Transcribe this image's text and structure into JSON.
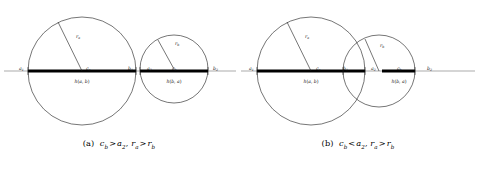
{
  "figure": {
    "name": "two-circle-hausdorff-interval-figure",
    "background_color": "#ffffff",
    "stroke_color": "#1a1a1a",
    "bold_segment_color": "#000000",
    "axis_color": "#555555"
  },
  "panels": [
    {
      "id": "a",
      "caption": {
        "tag": "(a)",
        "expr_1_lhs": "c",
        "expr_1_lhs_sub": "b",
        "expr_1_rel": ">",
        "expr_1_rhs": "a",
        "expr_1_rhs_sub": "2",
        "separator": ", ",
        "expr_2_lhs": "r",
        "expr_2_lhs_sub": "a",
        "expr_2_rel": ">",
        "expr_2_rhs": "r",
        "expr_2_rhs_sub": "b",
        "full_text": "(a) c_b > a_2, r_a > r_b"
      },
      "axis": {
        "y": 71,
        "x_start": 4,
        "x_end": 236
      },
      "circles": [
        {
          "name": "circle-a",
          "cx": 82,
          "cy": 71,
          "r": 54
        },
        {
          "name": "circle-b",
          "cx": 174,
          "cy": 69,
          "r": 34
        }
      ],
      "bold_intervals": [
        {
          "name": "interval-h-a-b",
          "x1": 28,
          "x2": 136,
          "y": 71,
          "label": "h(a, b)",
          "label_x": 82,
          "label_y": 83
        },
        {
          "name": "interval-h-b-a",
          "x1": 140,
          "x2": 208,
          "y": 71,
          "label": "h(b, a)",
          "label_x": 174,
          "label_y": 83
        }
      ],
      "radii": [
        {
          "name": "radius-ra",
          "x1": 82,
          "y1": 71,
          "x2": 58,
          "y2": 22,
          "label": "r",
          "label_sub": "a",
          "label_x": 76,
          "label_y": 38
        },
        {
          "name": "radius-rb",
          "x1": 174,
          "y1": 69,
          "x2": 158,
          "y2": 40,
          "label": "r",
          "label_sub": "b",
          "label_x": 175,
          "label_y": 45
        }
      ],
      "point_labels": [
        {
          "name": "label-a1",
          "text": "a",
          "sub": "1",
          "x": 19,
          "y": 70
        },
        {
          "name": "label-ca",
          "text": "c",
          "sub": "a",
          "x": 86,
          "y": 70
        },
        {
          "name": "label-b1",
          "text": "b",
          "sub": "1",
          "x": 128,
          "y": 70
        },
        {
          "name": "label-a2",
          "text": "a",
          "sub": "2",
          "x": 147,
          "y": 70
        },
        {
          "name": "label-cb",
          "text": "c",
          "sub": "b",
          "x": 172,
          "y": 70
        },
        {
          "name": "label-b2",
          "text": "b",
          "sub": "2",
          "x": 213,
          "y": 70
        }
      ]
    },
    {
      "id": "b",
      "caption": {
        "tag": "(b)",
        "expr_1_lhs": "c",
        "expr_1_lhs_sub": "b",
        "expr_1_rel": "<",
        "expr_1_rhs": "a",
        "expr_1_rhs_sub": "2",
        "separator": ", ",
        "expr_2_lhs": "r",
        "expr_2_lhs_sub": "a",
        "expr_2_rel": ">",
        "expr_2_rhs": "r",
        "expr_2_rhs_sub": "b",
        "full_text": "(b) c_b < a_2, r_a > r_b"
      },
      "axis": {
        "y": 71,
        "x_start": 2,
        "x_end": 236
      },
      "circles": [
        {
          "name": "circle-a",
          "cx": 72,
          "cy": 71,
          "r": 54
        },
        {
          "name": "circle-b",
          "cx": 140,
          "cy": 71,
          "r": 36
        }
      ],
      "bold_intervals": [
        {
          "name": "interval-h-a-b",
          "x1": 18,
          "x2": 126,
          "y": 71,
          "label": "h(a, b)",
          "label_x": 72,
          "label_y": 83
        },
        {
          "name": "interval-h-b-a",
          "x1": 143,
          "x2": 176,
          "y": 71,
          "label": "h(b, a)",
          "label_x": 160,
          "label_y": 83
        }
      ],
      "radii": [
        {
          "name": "radius-ra",
          "x1": 72,
          "y1": 71,
          "x2": 48,
          "y2": 22,
          "label": "r",
          "label_sub": "a",
          "label_x": 66,
          "label_y": 38
        },
        {
          "name": "radius-rb",
          "x1": 140,
          "y1": 71,
          "x2": 126,
          "y2": 39,
          "label": "r",
          "label_sub": "b",
          "label_x": 141,
          "label_y": 47
        }
      ],
      "point_labels": [
        {
          "name": "label-a1",
          "text": "a",
          "sub": "1",
          "x": 10,
          "y": 70
        },
        {
          "name": "label-ca",
          "text": "c",
          "sub": "a",
          "x": 77,
          "y": 70
        },
        {
          "name": "label-b1",
          "text": "b",
          "sub": "1",
          "x": 104,
          "y": 70
        },
        {
          "name": "label-a2",
          "text": "a",
          "sub": "2",
          "x": 132,
          "y": 70
        },
        {
          "name": "label-cb",
          "text": "c",
          "sub": "b",
          "x": 158,
          "y": 70
        },
        {
          "name": "label-b2",
          "text": "b",
          "sub": "2",
          "x": 188,
          "y": 70
        }
      ]
    }
  ]
}
